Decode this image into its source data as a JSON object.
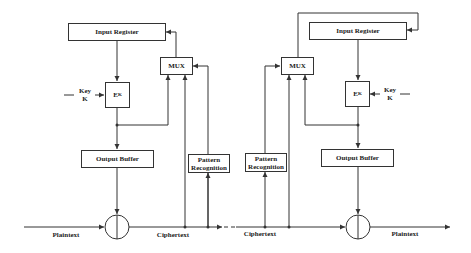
{
  "diagram": {
    "type": "cipher feedback (CFB) encryption/decryption with self-synchronization",
    "left": {
      "input_register": "Input Register",
      "mux": "MUX",
      "encrypt_block": "E",
      "encrypt_sub": "K",
      "key_label_1": "Key",
      "key_label_2": "K",
      "output_buffer": "Output Buffer",
      "pattern_1": "Pattern",
      "pattern_2": "Recognition",
      "plaintext": "Plaintext",
      "ciphertext": "Ciphertext"
    },
    "right": {
      "input_register": "Input Register",
      "mux": "MUX",
      "encrypt_block": "E",
      "encrypt_sub": "K",
      "key_label_1": "Key",
      "key_label_2": "K",
      "output_buffer": "Output Buffer",
      "pattern_1": "Pattern",
      "pattern_2": "Recognition",
      "plaintext": "Plaintext",
      "ciphertext": "Ciphertext"
    },
    "colors": {
      "line": "#333333",
      "background": "#ffffff"
    }
  }
}
